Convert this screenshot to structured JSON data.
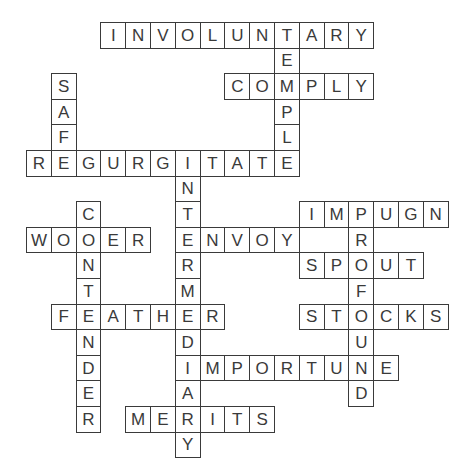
{
  "puzzle": {
    "type": "crossword-solution",
    "grid": {
      "origin_x": 26,
      "origin_y": 22,
      "cell_w": 24.8,
      "cell_h": 25.6
    },
    "colors": {
      "line": "#3a3a3a",
      "text": "#3a3a3a",
      "background": "#ffffff"
    },
    "words": [
      {
        "word": "INVOLUNTARY",
        "dir": "across",
        "row": 0,
        "col": 3
      },
      {
        "word": "TEMPLE",
        "dir": "down",
        "row": 0,
        "col": 10
      },
      {
        "word": "COMPLY",
        "dir": "across",
        "row": 2,
        "col": 8
      },
      {
        "word": "SAFE",
        "dir": "down",
        "row": 2,
        "col": 1
      },
      {
        "word": "REGURGITATE",
        "dir": "across",
        "row": 5,
        "col": 0
      },
      {
        "word": "INTERMEDIARY",
        "dir": "down",
        "row": 5,
        "col": 6
      },
      {
        "word": "CONTENDER",
        "dir": "down",
        "row": 7,
        "col": 2
      },
      {
        "word": "IMPUGN",
        "dir": "across",
        "row": 7,
        "col": 11
      },
      {
        "word": "PROFOUND",
        "dir": "down",
        "row": 7,
        "col": 13
      },
      {
        "word": "WOOER",
        "dir": "across",
        "row": 8,
        "col": 0
      },
      {
        "word": "ENVOY",
        "dir": "across",
        "row": 8,
        "col": 6
      },
      {
        "word": "SPOUT",
        "dir": "across",
        "row": 9,
        "col": 11
      },
      {
        "word": "FEATHER",
        "dir": "across",
        "row": 11,
        "col": 1
      },
      {
        "word": "STOCKS",
        "dir": "across",
        "row": 11,
        "col": 11
      },
      {
        "word": "IMPORTUNE",
        "dir": "across",
        "row": 13,
        "col": 6
      },
      {
        "word": "MERITS",
        "dir": "across",
        "row": 15,
        "col": 4
      }
    ]
  }
}
